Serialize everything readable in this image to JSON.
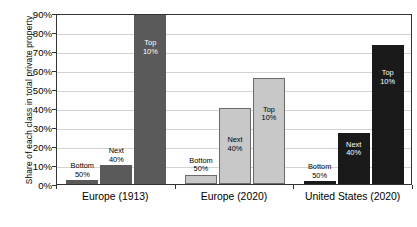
{
  "chart_data": {
    "type": "bar",
    "title": "",
    "subtitle": "",
    "xlabel": "",
    "ylabel": "Share of each class in total private property",
    "ylim": [
      0,
      90
    ],
    "ytick_labels": [
      "0%",
      "10%",
      "20%",
      "30%",
      "40%",
      "50%",
      "60%",
      "70%",
      "80%",
      "90%"
    ],
    "ytick_values": [
      0,
      10,
      20,
      30,
      40,
      50,
      60,
      70,
      80,
      90
    ],
    "grid": true,
    "legend": "none",
    "categories": [
      "Europe (1913)",
      "Europe (2020)",
      "United States (2020)"
    ],
    "series": [
      {
        "name": "Bottom 50%",
        "values": [
          2,
          5,
          1.5
        ]
      },
      {
        "name": "Next 40%",
        "values": [
          10,
          40,
          27
        ]
      },
      {
        "name": "Top 10%",
        "values": [
          89,
          56,
          73
        ]
      }
    ],
    "group_colors": [
      "#5a5a5a",
      "#c8c8c8",
      "#1a1a1a"
    ],
    "group_label_colors": [
      "#ffffff",
      "#000000",
      "#ffffff"
    ],
    "bar_annotations": [
      [
        {
          "line1": "Bottom",
          "line2": "50%"
        },
        {
          "line1": "Next",
          "line2": "40%"
        },
        {
          "line1": "Top",
          "line2": "10%"
        }
      ],
      [
        {
          "line1": "Bottom",
          "line2": "50%"
        },
        {
          "line1": "Next",
          "line2": "40%"
        },
        {
          "line1": "Top",
          "line2": "10%"
        }
      ],
      [
        {
          "line1": "Bottom",
          "line2": "50%"
        },
        {
          "line1": "Next",
          "line2": "40%"
        },
        {
          "line1": "Top",
          "line2": "10%"
        }
      ]
    ]
  },
  "axis": {
    "y_title": "Share of each class in total private property"
  }
}
